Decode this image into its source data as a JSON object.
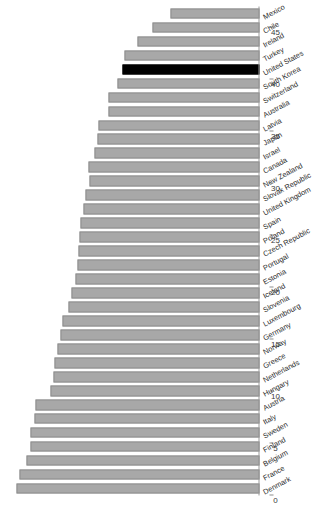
{
  "chart_data": {
    "type": "bar",
    "orientation": "rotated-90",
    "title": "",
    "subtitle": "",
    "xlabel": "",
    "ylabel": "",
    "ylim": [
      0,
      47
    ],
    "grid": false,
    "legend": null,
    "highlight": {
      "category": "United States",
      "color": "#000000",
      "note": "highlighted bar drawn in black"
    },
    "bar_color": "#a8a8a8",
    "axis_ticks": [
      0,
      5,
      10,
      15,
      20,
      25,
      30,
      35,
      40,
      45
    ],
    "tick_labels": [
      "0",
      "5",
      "10",
      "15",
      "20",
      "25",
      "30",
      "35",
      "40",
      "45"
    ],
    "categories": [
      "Denmark",
      "France",
      "Belgium",
      "Finland",
      "Sweden",
      "Italy",
      "Austria",
      "Hungary",
      "Netherlands",
      "Greece",
      "Norway",
      "Germany",
      "Luxembourg",
      "Slovenia",
      "Iceland",
      "Estonia",
      "Portugal",
      "Czech Republic",
      "Poland",
      "Spain",
      "United Kingdom",
      "Slovak Republic",
      "New Zealand",
      "Canada",
      "Israel",
      "Japan",
      "Latvia",
      "Australia",
      "Switzerland",
      "South Korea",
      "United States",
      "Turkey",
      "Ireland",
      "Chile",
      "Mexico"
    ],
    "values": [
      45.9,
      45.3,
      44.0,
      43.3,
      43.3,
      42.4,
      42.2,
      39.4,
      38.8,
      38.7,
      38.2,
      37.5,
      37.1,
      36.0,
      35.5,
      34.7,
      34.4,
      34.1,
      33.9,
      33.7,
      33.3,
      32.9,
      32.0,
      32.2,
      31.1,
      30.6,
      30.4,
      28.5,
      28.5,
      26.9,
      25.8,
      25.5,
      23.0,
      20.2,
      16.8
    ]
  }
}
